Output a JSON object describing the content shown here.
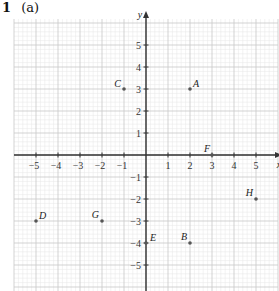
{
  "question": {
    "number": "1",
    "part": "(a)"
  },
  "axes": {
    "x_label": "x",
    "y_label": "y",
    "x_range": [
      -6,
      6
    ],
    "y_range": [
      -6,
      6
    ],
    "x_ticks": [
      -5,
      -4,
      -3,
      -2,
      -1,
      1,
      2,
      3,
      4,
      5
    ],
    "y_ticks": [
      -5,
      -4,
      -3,
      -2,
      -1,
      1,
      2,
      3,
      4,
      5
    ],
    "x_tick_labels": [
      "−5",
      "−4",
      "−3",
      "−2",
      "−1",
      "1",
      "2",
      "3",
      "4",
      "5"
    ],
    "y_tick_labels": [
      "−5",
      "−4",
      "−3",
      "−2",
      "−1",
      "1",
      "2",
      "3",
      "4",
      "5"
    ]
  },
  "points": [
    {
      "label": "A",
      "x": 2,
      "y": 3
    },
    {
      "label": "B",
      "x": 2,
      "y": -4
    },
    {
      "label": "C",
      "x": -1,
      "y": 3
    },
    {
      "label": "D",
      "x": -5,
      "y": -3
    },
    {
      "label": "E",
      "x": 0,
      "y": -4
    },
    {
      "label": "F",
      "x": 3,
      "y": 0
    },
    {
      "label": "G",
      "x": -2,
      "y": -3
    },
    {
      "label": "H",
      "x": 5,
      "y": -2
    }
  ],
  "colors": {
    "major_grid": "#c8c8c8",
    "minor_grid": "#e6e6e6",
    "axis": "#333333",
    "point": "#555555"
  }
}
